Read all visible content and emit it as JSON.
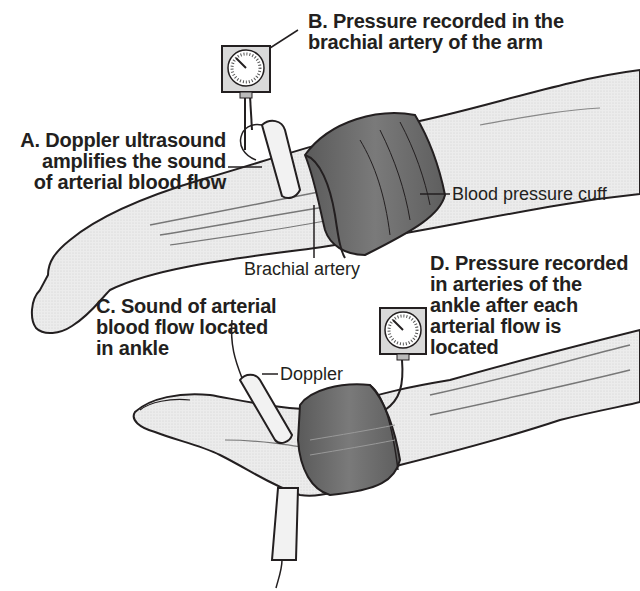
{
  "figure": {
    "type": "medical illustration",
    "colors": {
      "ink": "#231f20",
      "skin": "#e9e9e9",
      "cuff": "#6e6e6e",
      "cuff_dark": "#4a4a4a",
      "background": "#ffffff"
    }
  },
  "labels": {
    "a": {
      "line1": "A. Doppler ultrasound",
      "line2": "amplifies the sound",
      "line3": "of arterial blood flow"
    },
    "b": {
      "line1": "B. Pressure recorded in the",
      "line2": "brachial artery of the arm"
    },
    "c": {
      "line1": "C. Sound of arterial",
      "line2": "blood flow located",
      "line3": "in ankle"
    },
    "d": {
      "line1": "D. Pressure recorded",
      "line2": "in arteries of the",
      "line3": "ankle after each",
      "line4": "arterial flow is",
      "line5": "located"
    }
  },
  "callouts": {
    "cuff": "Blood pressure cuff",
    "artery": "Brachial artery",
    "doppler": "Doppler"
  },
  "icons": {
    "gauge_arm": "pressure-gauge-icon",
    "gauge_ankle": "pressure-gauge-icon",
    "probe_arm": "doppler-probe-icon",
    "probe_ankle_top": "doppler-probe-icon",
    "probe_ankle_bottom": "doppler-probe-icon"
  }
}
